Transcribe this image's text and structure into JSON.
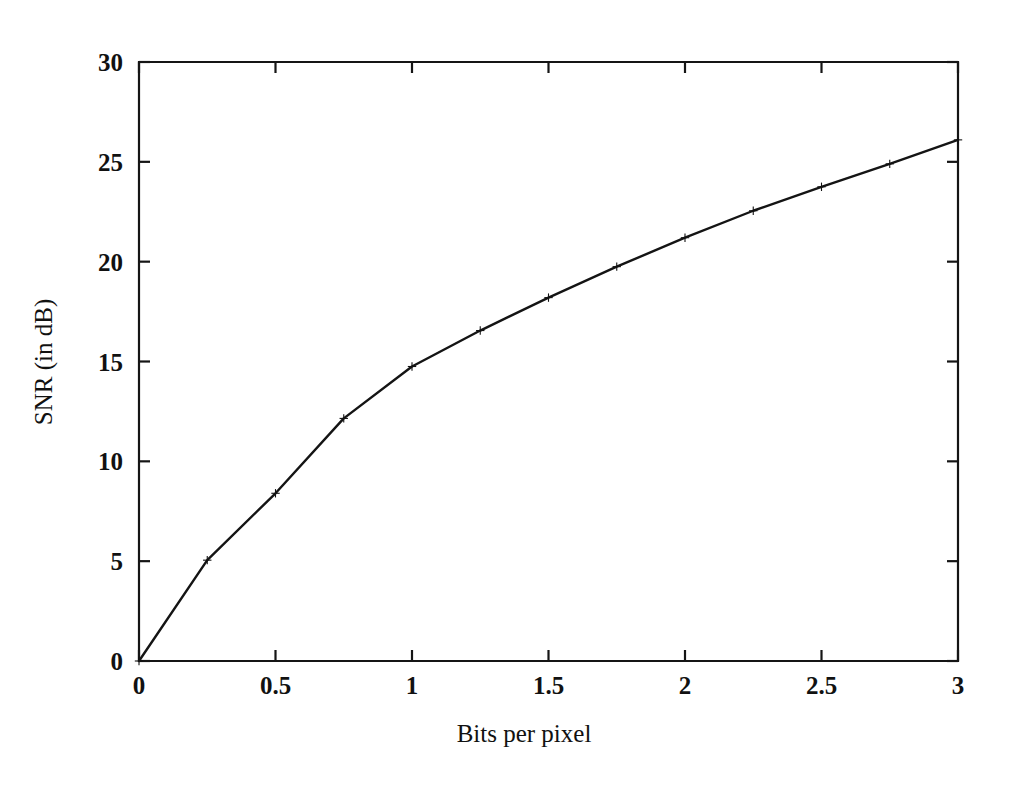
{
  "chart_data": {
    "type": "line",
    "title": "",
    "xlabel": "Bits per pixel",
    "ylabel": "SNR (in dB)",
    "xlim": [
      0,
      3
    ],
    "ylim": [
      0,
      30
    ],
    "xticks": [
      0,
      0.5,
      1,
      1.5,
      2,
      2.5,
      3
    ],
    "xtick_labels": [
      "0",
      "0.5",
      "1",
      "1.5",
      "2",
      "2.5",
      "3"
    ],
    "yticks": [
      0,
      5,
      10,
      15,
      20,
      25,
      30
    ],
    "ytick_labels": [
      "0",
      "5",
      "10",
      "15",
      "20",
      "25",
      "30"
    ],
    "grid": false,
    "legend": false,
    "legend_position": "none",
    "marker": "plus",
    "line_color": "#141414",
    "background_color": "#ffffff",
    "axis_color": "#151515",
    "tick_direction": "in",
    "box_frame": true,
    "x": [
      0,
      0.25,
      0.5,
      0.75,
      1,
      1.25,
      1.5,
      1.75,
      2,
      2.25,
      2.5,
      2.75,
      3
    ],
    "values": [
      0,
      5.05,
      8.4,
      12.15,
      14.75,
      16.55,
      18.2,
      19.75,
      21.2,
      22.55,
      23.75,
      24.9,
      26.1
    ],
    "series": [
      {
        "name": "SNR",
        "x": [
          0,
          0.25,
          0.5,
          0.75,
          1,
          1.25,
          1.5,
          1.75,
          2,
          2.25,
          2.5,
          2.75,
          3
        ],
        "values": [
          0,
          5.05,
          8.4,
          12.15,
          14.75,
          16.55,
          18.2,
          19.75,
          21.2,
          22.55,
          23.75,
          24.9,
          26.1
        ]
      }
    ]
  }
}
